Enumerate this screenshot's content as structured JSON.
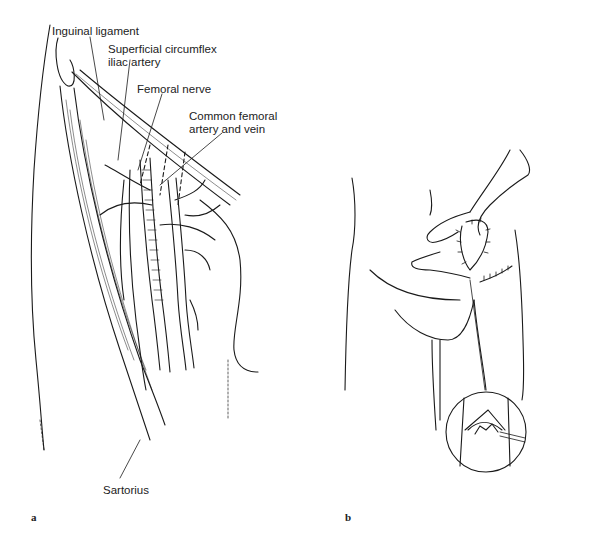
{
  "figure": {
    "panel_a": {
      "letter": "a",
      "labels": {
        "inguinal_ligament": "Inguinal ligament",
        "superficial_circumflex_line1": "Superficial circumflex",
        "superficial_circumflex_line2": "iliac artery",
        "femoral_nerve": "Femoral nerve",
        "common_femoral_line1": "Common femoral",
        "common_femoral_line2": "artery and vein",
        "sartorius": "Sartorius"
      }
    },
    "panel_b": {
      "letter": "b"
    },
    "colors": {
      "line": "#1a1a1a",
      "background": "#ffffff"
    }
  }
}
